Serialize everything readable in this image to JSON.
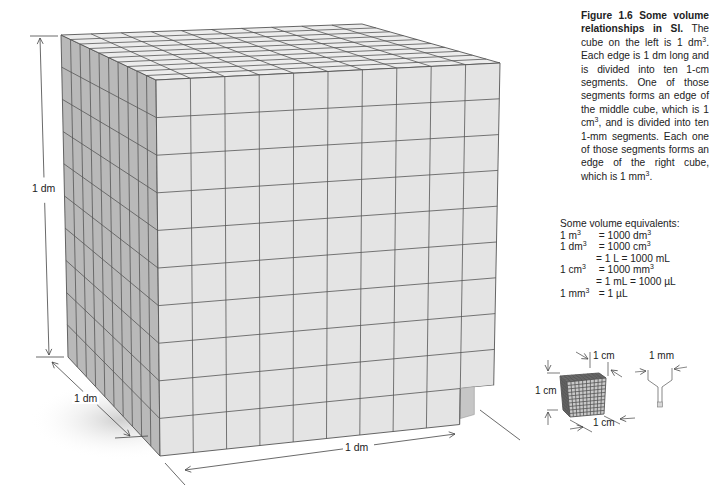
{
  "figure": {
    "caption_title": "Figure 1.6 Some volume relationships in SI.",
    "caption_parts": [
      "The cube on the left is 1 dm",
      ". Each edge is 1 dm long and is divided into ten 1-cm segments. One of those segments forms an edge of the middle cube, which is 1 cm",
      ", and is divided into ten 1-mm segments. Each one of those segments forms an edge of the right cube, which is 1 mm",
      "."
    ],
    "superscript": "3"
  },
  "equivalents": {
    "title": "Some volume equivalents:",
    "rows": [
      {
        "lhs": "1 m",
        "sup": "3",
        "rhs": " = 1000 dm",
        "rsup": "3"
      },
      {
        "lhs": "1 dm",
        "sup": "3",
        "rhs": " = 1000 cm",
        "rsup": "3"
      },
      {
        "lhs": "",
        "sup": "",
        "rhs": "= 1 L = 1000 mL",
        "rsup": ""
      },
      {
        "lhs": "1 cm",
        "sup": "3",
        "rhs": " = 1000 mm",
        "rsup": "3"
      },
      {
        "lhs": "",
        "sup": "",
        "rhs": "= 1 mL = 1000 µL",
        "rsup": ""
      },
      {
        "lhs": "1 mm",
        "sup": "3",
        "rhs": " = 1 µL",
        "rsup": ""
      }
    ]
  },
  "large_cube": {
    "label_height": "1 dm",
    "label_depth": "1 dm",
    "label_width": "1 dm",
    "divisions": 10
  },
  "middle_cube": {
    "label_top": "1 cm",
    "label_left": "1 cm",
    "label_bottom": "1 cm"
  },
  "small_cube": {
    "label": "1 mm"
  },
  "colors": {
    "front_face": "#e4e4e4",
    "side_face": "#b9b9b9",
    "top_face": "#ececec",
    "grid_line": "#555555"
  }
}
